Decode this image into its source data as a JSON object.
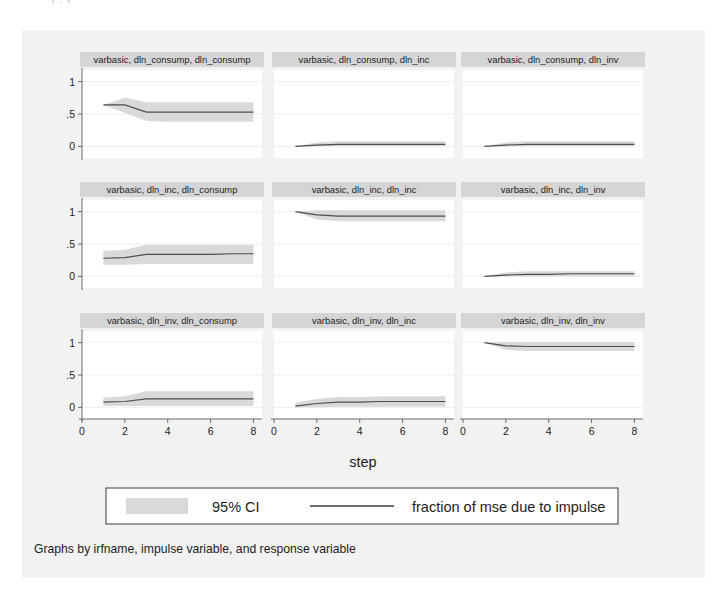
{
  "figure": {
    "background_color": "#f2f2f2",
    "axis_title": "step",
    "note": "Graphs by irfname, impulse variable, and response variable",
    "top_artifact_text": "l   .        l"
  },
  "legend": {
    "ci_label": "95% CI",
    "line_label": "fraction of mse due to impulse",
    "ci_color": "#d9d9d9",
    "line_color": "#3c3c3c"
  },
  "chart_data": {
    "type": "line",
    "title": "",
    "xlabel": "step",
    "ylabel": "",
    "xlim": [
      0,
      8.4
    ],
    "ylim": [
      -0.18,
      1.18
    ],
    "xticks": [
      0,
      2,
      4,
      6,
      8
    ],
    "xtick_labels": [
      "0",
      "2",
      "4",
      "6",
      "8"
    ],
    "yticks": [
      0,
      0.5,
      1
    ],
    "ytick_labels": [
      "0",
      ".5",
      "1"
    ],
    "grid": true,
    "legend_position": "bottom",
    "x": [
      1,
      2,
      3,
      4,
      5,
      6,
      7,
      8
    ],
    "panel_rows": 3,
    "panel_cols": 3,
    "panels": [
      {
        "title": "varbasic, dln_consump, dln_consump",
        "irfname": "varbasic",
        "impulse": "dln_consump",
        "response": "dln_consump",
        "row": 0,
        "col": 0,
        "values": [
          0.64,
          0.64,
          0.53,
          0.53,
          0.53,
          0.53,
          0.53,
          0.53
        ],
        "ci_lower": [
          0.64,
          0.52,
          0.39,
          0.38,
          0.38,
          0.38,
          0.38,
          0.38
        ],
        "ci_upper": [
          0.64,
          0.75,
          0.68,
          0.68,
          0.68,
          0.68,
          0.68,
          0.68
        ]
      },
      {
        "title": "varbasic, dln_consump, dln_inc",
        "irfname": "varbasic",
        "impulse": "dln_consump",
        "response": "dln_inc",
        "row": 0,
        "col": 1,
        "values": [
          0.0,
          0.02,
          0.03,
          0.03,
          0.03,
          0.03,
          0.03,
          0.03
        ],
        "ci_lower": [
          0.0,
          0.0,
          0.0,
          0.0,
          0.0,
          0.0,
          0.0,
          0.0
        ],
        "ci_upper": [
          0.0,
          0.06,
          0.08,
          0.08,
          0.08,
          0.08,
          0.08,
          0.08
        ]
      },
      {
        "title": "varbasic, dln_consump, dln_inv",
        "irfname": "varbasic",
        "impulse": "dln_consump",
        "response": "dln_inv",
        "row": 0,
        "col": 2,
        "values": [
          0.0,
          0.02,
          0.03,
          0.03,
          0.03,
          0.03,
          0.03,
          0.03
        ],
        "ci_lower": [
          0.0,
          0.0,
          0.0,
          0.0,
          0.0,
          0.0,
          0.0,
          0.0
        ],
        "ci_upper": [
          0.0,
          0.06,
          0.08,
          0.08,
          0.08,
          0.08,
          0.08,
          0.08
        ]
      },
      {
        "title": "varbasic, dln_inc, dln_consump",
        "irfname": "varbasic",
        "impulse": "dln_inc",
        "response": "dln_consump",
        "row": 1,
        "col": 0,
        "values": [
          0.28,
          0.29,
          0.34,
          0.34,
          0.34,
          0.34,
          0.35,
          0.35
        ],
        "ci_lower": [
          0.18,
          0.18,
          0.19,
          0.19,
          0.19,
          0.19,
          0.19,
          0.19
        ],
        "ci_upper": [
          0.39,
          0.41,
          0.49,
          0.49,
          0.49,
          0.49,
          0.49,
          0.49
        ]
      },
      {
        "title": "varbasic, dln_inc, dln_inc",
        "irfname": "varbasic",
        "impulse": "dln_inc",
        "response": "dln_inc",
        "row": 1,
        "col": 1,
        "values": [
          1.0,
          0.95,
          0.93,
          0.93,
          0.93,
          0.93,
          0.93,
          0.93
        ],
        "ci_lower": [
          1.0,
          0.88,
          0.85,
          0.85,
          0.85,
          0.85,
          0.85,
          0.85
        ],
        "ci_upper": [
          1.0,
          1.02,
          1.02,
          1.02,
          1.02,
          1.02,
          1.02,
          1.02
        ]
      },
      {
        "title": "varbasic, dln_inc, dln_inv",
        "irfname": "varbasic",
        "impulse": "dln_inc",
        "response": "dln_inv",
        "row": 1,
        "col": 2,
        "values": [
          0.0,
          0.02,
          0.03,
          0.03,
          0.04,
          0.04,
          0.04,
          0.04
        ],
        "ci_lower": [
          0.0,
          0.0,
          0.0,
          0.0,
          0.0,
          0.0,
          0.0,
          0.0
        ],
        "ci_upper": [
          0.0,
          0.06,
          0.08,
          0.08,
          0.08,
          0.08,
          0.08,
          0.08
        ]
      },
      {
        "title": "varbasic, dln_inv, dln_consump",
        "irfname": "varbasic",
        "impulse": "dln_inv",
        "response": "dln_consump",
        "row": 2,
        "col": 0,
        "values": [
          0.08,
          0.09,
          0.13,
          0.13,
          0.13,
          0.13,
          0.13,
          0.13
        ],
        "ci_lower": [
          0.02,
          0.02,
          0.02,
          0.02,
          0.02,
          0.02,
          0.02,
          0.02
        ],
        "ci_upper": [
          0.15,
          0.17,
          0.25,
          0.25,
          0.25,
          0.25,
          0.25,
          0.25
        ]
      },
      {
        "title": "varbasic, dln_inv, dln_inc",
        "irfname": "varbasic",
        "impulse": "dln_inv",
        "response": "dln_inc",
        "row": 2,
        "col": 1,
        "values": [
          0.02,
          0.06,
          0.08,
          0.08,
          0.09,
          0.09,
          0.09,
          0.09
        ],
        "ci_lower": [
          0.0,
          0.0,
          0.01,
          0.01,
          0.01,
          0.01,
          0.01,
          0.01
        ],
        "ci_upper": [
          0.07,
          0.13,
          0.16,
          0.16,
          0.17,
          0.17,
          0.17,
          0.17
        ]
      },
      {
        "title": "varbasic, dln_inv, dln_inv",
        "irfname": "varbasic",
        "impulse": "dln_inv",
        "response": "dln_inv",
        "row": 2,
        "col": 2,
        "values": [
          1.0,
          0.95,
          0.94,
          0.94,
          0.94,
          0.94,
          0.94,
          0.94
        ],
        "ci_lower": [
          1.0,
          0.89,
          0.87,
          0.87,
          0.87,
          0.87,
          0.87,
          0.87
        ],
        "ci_upper": [
          1.0,
          1.01,
          1.01,
          1.01,
          1.01,
          1.01,
          1.01,
          1.01
        ]
      }
    ]
  }
}
